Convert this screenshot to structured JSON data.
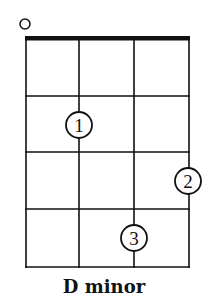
{
  "chord": {
    "name": "D minor",
    "instrument_strings": 4,
    "frets_shown": 4,
    "open_strings": [
      1
    ],
    "fingers": [
      {
        "finger": "1",
        "string": 2,
        "fret": 2
      },
      {
        "finger": "2",
        "string": 4,
        "fret": 3
      },
      {
        "finger": "3",
        "string": 3,
        "fret": 4
      }
    ],
    "open_marker": "○"
  },
  "colors": {
    "line": "#111111",
    "background": "#ffffff"
  }
}
